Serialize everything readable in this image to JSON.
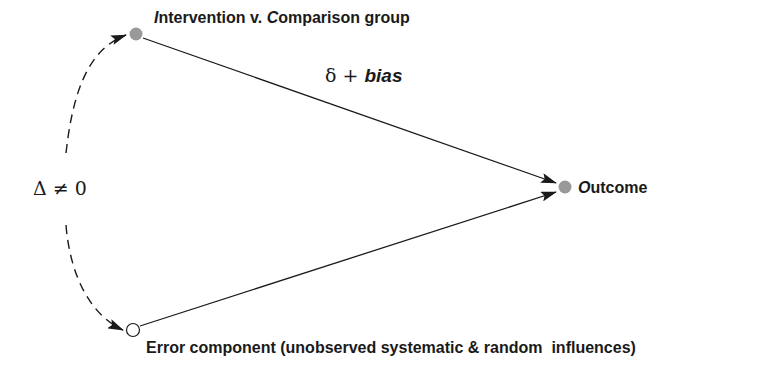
{
  "diagram": {
    "nodes": {
      "intervention": {
        "label_initial": "I",
        "label_rest": "ntervention v. ",
        "label_initial2": "C",
        "label_rest2": "omparison group",
        "fill": "#999999"
      },
      "outcome": {
        "label_initial": "O",
        "label_rest": "utcome",
        "fill": "#999999"
      },
      "error": {
        "label_initial": "E",
        "label_rest": "rror component (unobserved systematic & random  influences)",
        "fill": "#ffffff"
      }
    },
    "edges": {
      "intervention_to_outcome": {
        "label_delta": "δ + ",
        "label_bias": "bias"
      },
      "error_to_outcome": {},
      "correlation": {
        "label": "Δ ≠ 0",
        "style": "dashed"
      }
    },
    "colors": {
      "line": "#1a1a1a",
      "filled_node": "#999999"
    }
  }
}
